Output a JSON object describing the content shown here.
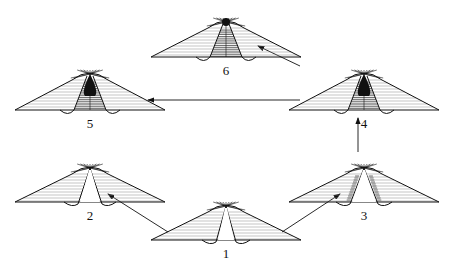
{
  "diagram": {
    "type": "stage-sequence",
    "stages": [
      {
        "id": 1,
        "label": "1",
        "cx": 226,
        "base_y": 240,
        "apex_y": 200,
        "half_width": 75,
        "variant": "open-cleft"
      },
      {
        "id": 2,
        "label": "2",
        "cx": 90,
        "base_y": 202,
        "apex_y": 162,
        "half_width": 75,
        "variant": "narrow-cleft"
      },
      {
        "id": 3,
        "label": "3",
        "cx": 364,
        "base_y": 202,
        "apex_y": 162,
        "half_width": 75,
        "variant": "dense-cleft"
      },
      {
        "id": 4,
        "label": "4",
        "cx": 364,
        "base_y": 110,
        "apex_y": 68,
        "half_width": 75,
        "variant": "filled-core"
      },
      {
        "id": 5,
        "label": "5",
        "cx": 90,
        "base_y": 110,
        "apex_y": 68,
        "half_width": 75,
        "variant": "filled-core"
      },
      {
        "id": 6,
        "label": "6",
        "cx": 226,
        "base_y": 57,
        "apex_y": 16,
        "half_width": 75,
        "variant": "dot-core"
      }
    ],
    "arrows": [
      {
        "from": 1,
        "to": 2
      },
      {
        "from": 1,
        "to": 3
      },
      {
        "from": 3,
        "to": 4
      },
      {
        "from": 4,
        "to": 5
      },
      {
        "from": 4,
        "to": 6
      }
    ],
    "colors": {
      "ink": "#111111",
      "hatch": "#888888",
      "background": "#ffffff"
    }
  }
}
